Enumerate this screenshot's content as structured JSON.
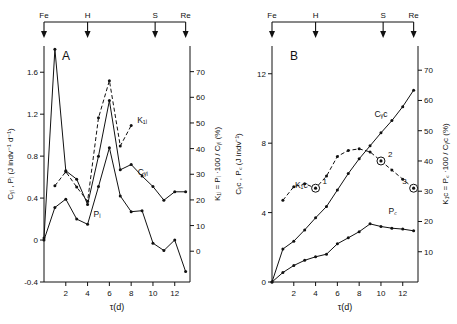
{
  "figure": {
    "event_axis": {
      "labels": [
        "Fe",
        "H",
        "S",
        "Re"
      ],
      "positions_tau": [
        0,
        4,
        10.2,
        13
      ]
    },
    "xaxis": {
      "title": "τ(d)",
      "ticks": [
        2,
        4,
        6,
        8,
        10,
        12
      ],
      "range": [
        0,
        13.4
      ]
    }
  },
  "chart_data": [
    {
      "type": "line",
      "panel": "A",
      "title": "A",
      "xlabel": "τ(d)",
      "ylabel": "Cᵧᵢ , Pᵢ (J indv⁻¹ d⁻¹)",
      "y2label": "K₁ᵢ = Pᵢ ·100 / Cᵧᵢ (%)",
      "x": [
        0,
        1,
        2,
        3,
        4,
        5,
        6,
        7,
        8,
        9,
        10,
        11,
        12,
        13
      ],
      "ylim": [
        -0.4,
        1.85
      ],
      "y2lim": [
        -12,
        80
      ],
      "yticks": [
        1.6,
        1.2,
        0.8,
        0.4,
        0,
        -0.4
      ],
      "y2ticks": [
        70,
        60,
        50,
        40,
        30,
        20,
        10,
        0
      ],
      "grid": false,
      "series": [
        {
          "name": "Cᵧᵢ",
          "label": "Cᵧᵢ",
          "style": "solid",
          "axis": "left",
          "values": [
            0.02,
            1.82,
            0.66,
            0.58,
            0.34,
            0.8,
            1.33,
            0.67,
            0.72,
            0.61,
            0.51,
            0.38,
            0.46,
            0.46
          ]
        },
        {
          "name": "K₁ᵢ",
          "label": "K₁ᵢ",
          "style": "dashed",
          "axis": "right",
          "values": [
            null,
            25.5,
            31.0,
            25.0,
            19.5,
            52.0,
            66.5,
            41.0,
            49.0,
            null,
            null,
            null,
            null,
            null
          ]
        },
        {
          "name": "Pᵢ",
          "label": "Pᵢ",
          "style": "solid",
          "axis": "left",
          "values": [
            0.0,
            0.31,
            0.39,
            0.2,
            0.15,
            0.51,
            0.88,
            0.42,
            0.27,
            0.28,
            -0.03,
            -0.1,
            0.0,
            -0.3
          ]
        }
      ]
    },
    {
      "type": "line",
      "panel": "B",
      "title": "B",
      "xlabel": "τ(d)",
      "ylabel": "Cᵧc , P꜀ (J indv⁻¹)",
      "y2label": "K₁c = P꜀ ·100 / Cᵧc (%)",
      "ylim": [
        0,
        13.6
      ],
      "y2lim": [
        0,
        78
      ],
      "yticks": [
        12,
        8,
        4,
        0
      ],
      "y2ticks": [
        70,
        60,
        50,
        40,
        30,
        20,
        10
      ],
      "grid": false,
      "series": [
        {
          "name": "Cᵧc",
          "label": "Cᵧc",
          "style": "solid",
          "axis": "left",
          "x": [
            0,
            1,
            2,
            3,
            4,
            5,
            6,
            7,
            8,
            9,
            10,
            11,
            12,
            13
          ],
          "values": [
            0,
            1.9,
            2.35,
            3.0,
            3.7,
            4.35,
            5.3,
            6.25,
            7.1,
            7.85,
            8.6,
            9.3,
            10.1,
            11.05
          ]
        },
        {
          "name": "K₁c",
          "label": "K₁c",
          "style": "dashed",
          "axis": "right",
          "x": [
            1,
            2,
            3,
            4,
            5,
            6,
            7,
            8,
            9,
            10,
            11,
            12,
            13
          ],
          "values": [
            27.0,
            31.5,
            32.5,
            31.0,
            35.0,
            41.5,
            43.5,
            44.0,
            43.0,
            40.0,
            37.0,
            34.0,
            31.0
          ]
        },
        {
          "name": "P꜀",
          "label": "P꜀",
          "style": "solid",
          "axis": "left",
          "x": [
            0,
            1,
            2,
            3,
            4,
            5,
            6,
            7,
            8,
            9,
            10,
            11,
            12,
            13
          ],
          "values": [
            0,
            0.55,
            0.95,
            1.25,
            1.45,
            1.6,
            2.2,
            2.55,
            2.9,
            3.35,
            3.2,
            3.1,
            3.05,
            2.95
          ]
        }
      ],
      "annotations": [
        {
          "label": "1",
          "x": 4,
          "y_right": 31.0
        },
        {
          "label": "2",
          "x": 10,
          "y_right": 40.0
        },
        {
          "label": "3",
          "x": 13,
          "y_right": 31.0
        }
      ]
    }
  ]
}
